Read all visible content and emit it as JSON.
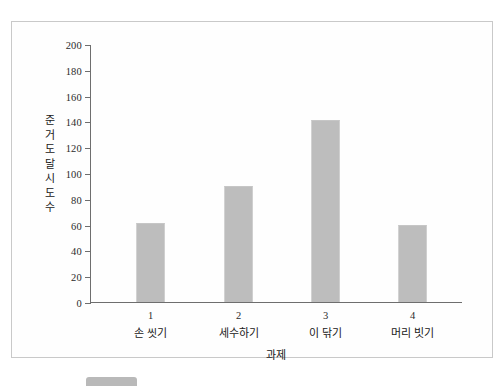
{
  "document": {
    "type": "scanned-figure",
    "background_color": "#ffffff",
    "frame_border_color": "#c9c9c9",
    "bottom_artifact": "scan-edge-artifact"
  },
  "chart_data": {
    "type": "bar",
    "title": "",
    "xlabel": "과제",
    "ylabel": "준거 도달 시도 수",
    "ylabel_chars": [
      "준",
      "거",
      "도",
      "달",
      "시",
      "도",
      "수"
    ],
    "categories": [
      "1",
      "2",
      "3",
      "4"
    ],
    "category_names": [
      "손 씻기",
      "세수하기",
      "이 닦기",
      "머리 빗기"
    ],
    "category_labels": [
      "1 손 씻기",
      "2 세수하기",
      "3 이 닦기",
      "4 머리 빗기"
    ],
    "values": [
      61,
      90,
      141,
      60
    ],
    "ylim": [
      0,
      200
    ],
    "ytick_step": 20,
    "yticks": [
      0,
      20,
      40,
      60,
      80,
      100,
      120,
      140,
      160,
      180,
      200
    ],
    "ytick_labels": [
      "0",
      "20",
      "40",
      "60",
      "80",
      "100",
      "120",
      "140",
      "160",
      "180",
      "200"
    ],
    "grid": false,
    "legend": false,
    "bar_color": "#bdbdbd",
    "axis_color": "#6e6e6e",
    "text_color": "#202020"
  }
}
